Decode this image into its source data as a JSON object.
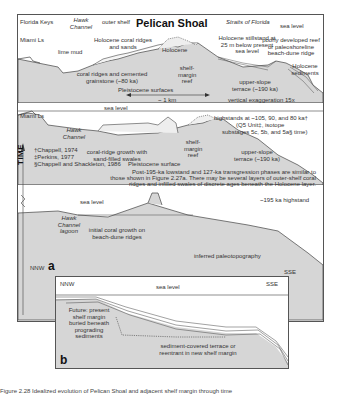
{
  "figure": {
    "title": "Pelican Shoal",
    "panel_a_letter": "a",
    "panel_b_letter": "b",
    "axis_label_time": "TIME"
  },
  "panel_a": {
    "top_headers": {
      "florida_keys": "Florida Keys",
      "hawk_channel": "Hawk Channel",
      "outer_shelf": "outer shelf",
      "straits": "Straits of Florida",
      "sea_level": "sea level"
    },
    "stage1": {
      "miami_ls": "Miami Ls",
      "lime_mud": "lime mud",
      "holocene_coral_ridges": "Holocene coral ridges and sands",
      "holocene": "Holocene",
      "coral_ridges_grainstone": "coral ridges and cemented grainstone (~80 ka)",
      "shelf_margin_reef": "shelf-margin reef",
      "pleistocene_surfaces": "Pleistocene surfaces",
      "holocene_stillstand": "Holocene stillstand at 25 m below present sea level",
      "poorly_developed_reef": "poorly developed reef or paleoshoreline beach-dune ridge",
      "holocene_sediments": "Holocene sediments",
      "upper_slope_terrace": "upper-slope terrace (~190 ka)",
      "scale": "~ 1 km",
      "vertical_exaggeration": "vertical exaggeration 15x"
    },
    "stage2": {
      "miami_ls": "Miami Ls",
      "sea_level": "sea level",
      "hawk_channel": "Hawk Channel",
      "coral_ridge_growth": "coral-ridge growth with sand-filled swales",
      "pleistocene_surface": "Pleistocene surface",
      "shelf_margin_reef": "shelf-margin reef",
      "highstands": "highstands at ~105, 90, and 80 ka†",
      "q5_unit": "(Q5 Unit‡, isotope",
      "substages": "substages 5c, 5b, and 5a§ time)",
      "upper_slope_terrace": "upper-slope terrace (~190 ka)",
      "refs": [
        "†Chappell, 1974",
        "‡Perkins, 1977",
        "§Chappell and Shackleton, 1986"
      ],
      "note": [
        "Post-195-ka lowstand and 127-ka transgression phases are similar to",
        "those shown in Figure 2.27a. There may be several layers of outer-shelf coral",
        "ridges and infilled swales of discrete ages beneath the Holocene layer."
      ]
    },
    "stage3": {
      "sea_level": "sea level",
      "hawk_channel_lagoon": "Hawk Channel lagoon",
      "initial_coral_growth": "initial coral growth on beach-dune ridges",
      "highstand_195": "~195 ka highstand",
      "inferred_paleotopography": "inferred paleotopography",
      "nnw": "NNW",
      "sse": "SSE"
    }
  },
  "panel_b": {
    "nnw": "NNW",
    "sse": "SSE",
    "sea_level": "sea level",
    "future": "Future: present shelf margin buried beneath prograding sediments",
    "sediment_terrace": "sediment-covered terrace or reentrant in new shelf margin"
  },
  "caption": "Figure 2.28 Idealized evolution of Pelican Shoal and adjacent shelf margin through time",
  "colors": {
    "rock_fill": "#d6d6d6",
    "line": "#444444",
    "background": "#ffffff"
  }
}
